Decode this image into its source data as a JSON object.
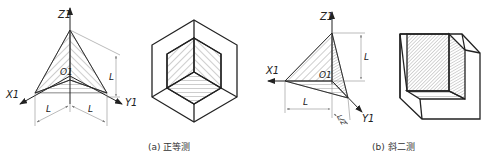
{
  "figures": [
    {
      "id": "a",
      "caption": "(a) 正等测",
      "axes": {
        "z": "Z1",
        "x": "X1",
        "y": "Y1",
        "origin": "O1"
      },
      "dimensions": [
        "L",
        "L",
        "L"
      ]
    },
    {
      "id": "b",
      "caption": "(b) 斜二测",
      "axes": {
        "z": "Z1",
        "x": "X1",
        "y": "Y1",
        "origin": "O1"
      },
      "dimensions": [
        "L",
        "L",
        "L/2"
      ]
    }
  ],
  "colors": {
    "line": "#222222",
    "dim": "#777777",
    "hatch": "#555555"
  }
}
